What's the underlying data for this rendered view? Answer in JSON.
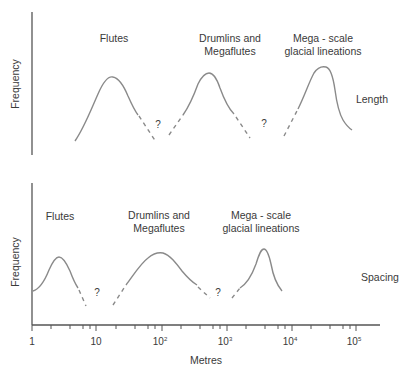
{
  "figure": {
    "x_axis": {
      "label": "Metres",
      "scale": "log",
      "ticks": [
        {
          "base": "1",
          "exp": ""
        },
        {
          "base": "10",
          "exp": ""
        },
        {
          "base": "10",
          "exp": "2"
        },
        {
          "base": "10",
          "exp": "3"
        },
        {
          "base": "10",
          "exp": "4"
        },
        {
          "base": "10",
          "exp": "5"
        }
      ]
    },
    "panels": [
      {
        "name": "length",
        "y_label": "Frequency",
        "side_label": "Length",
        "unknown_marker": "?",
        "groups": [
          {
            "label_line1": "Flutes",
            "label_line2": ""
          },
          {
            "label_line1": "Drumlins and",
            "label_line2": "Megaflutes"
          },
          {
            "label_line1": "Mega - scale",
            "label_line2": "glacial lineations"
          }
        ]
      },
      {
        "name": "spacing",
        "y_label": "Frequency",
        "side_label": "Spacing",
        "unknown_marker": "?",
        "groups": [
          {
            "label_line1": "Flutes",
            "label_line2": ""
          },
          {
            "label_line1": "Drumlins and",
            "label_line2": "Megaflutes"
          },
          {
            "label_line1": "Mega - scale",
            "label_line2": "glacial lineations"
          }
        ]
      }
    ],
    "colors": {
      "axis": "#555555",
      "curve": "#8a8a8a",
      "text": "#3a3a3a"
    }
  }
}
